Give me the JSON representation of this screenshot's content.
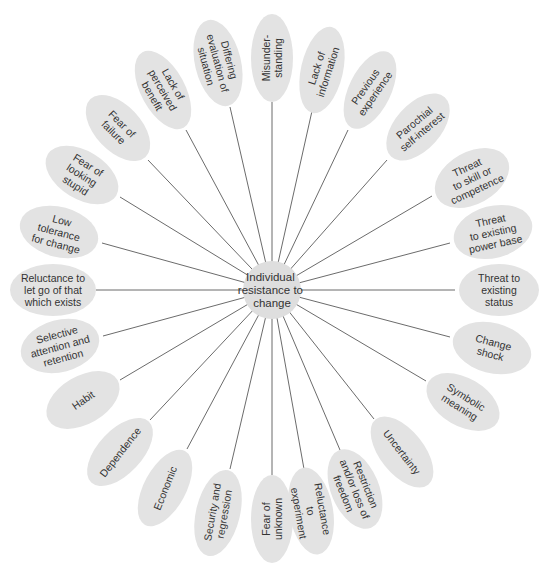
{
  "diagram": {
    "title": "Individual resistance to change",
    "hub": {
      "label_lines": [
        "Individual",
        "resistance to",
        "change"
      ],
      "cx": 272,
      "cy": 290,
      "r": 29,
      "fill": "#dedede"
    },
    "colors": {
      "background": "#ffffff",
      "node_fill": "#e3e3e3",
      "line": "#5a5a5a",
      "text": "#333333"
    },
    "nodes": [
      {
        "id": "misunderstanding",
        "lines": [
          "Misunder-",
          "standing"
        ],
        "cx": 272,
        "cy": 58,
        "rx": 21,
        "ry": 44,
        "rot": -90,
        "attach": [
          272,
          102
        ]
      },
      {
        "id": "lack-of-information",
        "lines": [
          "Lack of",
          "information"
        ],
        "cx": 322,
        "cy": 70,
        "rx": 21,
        "ry": 44,
        "rot": -72,
        "attach": [
          312,
          111
        ]
      },
      {
        "id": "previous-experience",
        "lines": [
          "Previous",
          "experience"
        ],
        "cx": 370,
        "cy": 90,
        "rx": 21,
        "ry": 42,
        "rot": -55,
        "attach": [
          348,
          130
        ]
      },
      {
        "id": "parochial-self-interest",
        "lines": [
          "Parochial",
          "self-interest"
        ],
        "cx": 418,
        "cy": 127,
        "rx": 23,
        "ry": 40,
        "rot": -40,
        "attach": [
          387,
          160
        ]
      },
      {
        "id": "threat-to-skill",
        "lines": [
          "Threat",
          "to skill or",
          "competence"
        ],
        "cx": 472,
        "cy": 178,
        "rx": 26,
        "ry": 40,
        "rot": -25,
        "attach": [
          432,
          196
        ]
      },
      {
        "id": "threat-to-power-base",
        "lines": [
          "Threat",
          "to existing",
          "power base"
        ],
        "cx": 493,
        "cy": 232,
        "rx": 26,
        "ry": 40,
        "rot": -12,
        "attach": [
          450,
          243
        ]
      },
      {
        "id": "threat-to-status",
        "lines": [
          "Threat to",
          "existing",
          "status"
        ],
        "cx": 499,
        "cy": 290,
        "rx": 26,
        "ry": 40,
        "rot": 0,
        "attach": [
          455,
          290
        ]
      },
      {
        "id": "change-shock",
        "lines": [
          "Change",
          "shock"
        ],
        "cx": 492,
        "cy": 348,
        "rx": 25,
        "ry": 40,
        "rot": 15,
        "attach": [
          450,
          337
        ]
      },
      {
        "id": "symbolic-meaning",
        "lines": [
          "Symbolic",
          "meaning"
        ],
        "cx": 463,
        "cy": 402,
        "rx": 24,
        "ry": 40,
        "rot": 32,
        "attach": [
          426,
          381
        ]
      },
      {
        "id": "uncertainty",
        "lines": [
          "Uncertainty"
        ],
        "cx": 402,
        "cy": 452,
        "rx": 22,
        "ry": 42,
        "rot": 52,
        "attach": [
          374,
          419
        ]
      },
      {
        "id": "restriction-loss-freedom",
        "lines": [
          "Restriction",
          "and/or loss of",
          "freedom"
        ],
        "cx": 355,
        "cy": 489,
        "rx": 24,
        "ry": 42,
        "rot": 68,
        "attach": [
          340,
          450
        ]
      },
      {
        "id": "reluctance-to-experiment",
        "lines": [
          "Reluctance",
          "to",
          "experiment"
        ],
        "cx": 311,
        "cy": 511,
        "rx": 22,
        "ry": 44,
        "rot": 80,
        "attach": [
          304,
          469
        ]
      },
      {
        "id": "fear-of-unknown",
        "lines": [
          "Fear of",
          "unknown"
        ],
        "cx": 272,
        "cy": 519,
        "rx": 21,
        "ry": 44,
        "rot": -90,
        "attach": [
          272,
          475
        ]
      },
      {
        "id": "security-and-regression",
        "lines": [
          "Security and",
          "regression"
        ],
        "cx": 218,
        "cy": 513,
        "rx": 22,
        "ry": 44,
        "rot": -80,
        "attach": [
          230,
          469
        ]
      },
      {
        "id": "economic",
        "lines": [
          "Economic"
        ],
        "cx": 165,
        "cy": 488,
        "rx": 21,
        "ry": 42,
        "rot": -68,
        "attach": [
          187,
          449
        ]
      },
      {
        "id": "dependence",
        "lines": [
          "Dependence"
        ],
        "cx": 120,
        "cy": 452,
        "rx": 22,
        "ry": 42,
        "rot": -52,
        "attach": [
          150,
          420
        ]
      },
      {
        "id": "habit",
        "lines": [
          "Habit"
        ],
        "cx": 83,
        "cy": 400,
        "rx": 24,
        "ry": 40,
        "rot": -35,
        "attach": [
          120,
          380
        ]
      },
      {
        "id": "selective-attention",
        "lines": [
          "Selective",
          "attention and",
          "retention"
        ],
        "cx": 60,
        "cy": 346,
        "rx": 26,
        "ry": 40,
        "rot": -15,
        "attach": [
          103,
          336
        ]
      },
      {
        "id": "reluctance-to-let-go",
        "lines": [
          "Reluctance to",
          "let go of that",
          "which exists"
        ],
        "cx": 53,
        "cy": 290,
        "rx": 26,
        "ry": 43,
        "rot": 0,
        "attach": [
          96,
          290
        ]
      },
      {
        "id": "low-tolerance",
        "lines": [
          "Low",
          "tolerance",
          "for change"
        ],
        "cx": 59,
        "cy": 232,
        "rx": 25,
        "ry": 40,
        "rot": 15,
        "attach": [
          102,
          243
        ]
      },
      {
        "id": "fear-of-looking-stupid",
        "lines": [
          "Fear of",
          "looking",
          "stupid"
        ],
        "cx": 82,
        "cy": 175,
        "rx": 24,
        "ry": 40,
        "rot": 32,
        "attach": [
          120,
          197
        ]
      },
      {
        "id": "fear-of-failure",
        "lines": [
          "Fear of",
          "failure"
        ],
        "cx": 118,
        "cy": 128,
        "rx": 23,
        "ry": 40,
        "rot": 45,
        "attach": [
          148,
          160
        ]
      },
      {
        "id": "lack-of-perceived-benefit",
        "lines": [
          "Lack of",
          "perceived",
          "benefit"
        ],
        "cx": 163,
        "cy": 90,
        "rx": 22,
        "ry": 43,
        "rot": 60,
        "attach": [
          186,
          130
        ]
      },
      {
        "id": "differing-evaluation",
        "lines": [
          "Differing",
          "evaluation of",
          "situation"
        ],
        "cx": 218,
        "cy": 63,
        "rx": 23,
        "ry": 44,
        "rot": 75,
        "attach": [
          230,
          107
        ]
      }
    ]
  }
}
